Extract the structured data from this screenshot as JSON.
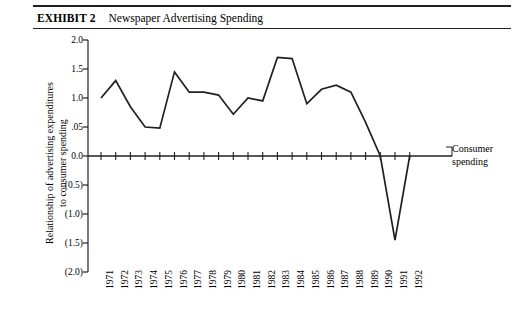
{
  "exhibit": {
    "label": "EXHIBIT 2",
    "title": "Newspaper Advertising Spending"
  },
  "annotation": {
    "line1": "Consumer",
    "line2": "spending"
  },
  "chart_data": {
    "type": "line",
    "title": "Newspaper Advertising Spending",
    "xlabel": "",
    "ylabel_line1": "Relationship of advertising expenditures",
    "ylabel_line2": "to consumer spending",
    "ylim": [
      -2.0,
      2.0
    ],
    "ytick_values": [
      2.0,
      1.5,
      1.0,
      0.5,
      0.0,
      -0.5,
      -1.0,
      -1.5,
      -2.0
    ],
    "ytick_labels": [
      "2.0",
      "1.5",
      "1.0",
      ".05",
      "0.0",
      "(0.5)",
      "(1.0)",
      "(1.5)",
      "(2.0)"
    ],
    "grid": false,
    "legend": "none",
    "zero_reference_label": "Consumer spending",
    "categories": [
      "1971",
      "1972",
      "1973",
      "1974",
      "1975",
      "1976",
      "1977",
      "1978",
      "1979",
      "1980",
      "1981",
      "1982",
      "1983",
      "1984",
      "1985",
      "1986",
      "1987",
      "1988",
      "1989",
      "1990",
      "1991",
      "1992"
    ],
    "values": [
      1.0,
      1.3,
      0.85,
      0.5,
      0.48,
      1.45,
      1.1,
      1.1,
      1.05,
      0.72,
      1.0,
      0.95,
      1.7,
      1.68,
      0.9,
      1.15,
      1.22,
      1.1,
      0.58,
      0.0,
      -1.45,
      0.0
    ],
    "series_color": "#231f20",
    "axis_color": "#231f20"
  }
}
